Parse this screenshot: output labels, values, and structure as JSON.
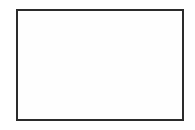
{
  "screen": {
    "name": "graphing-calculator-screen",
    "background_color": "#ffffff",
    "width": 195,
    "height": 130,
    "frame": {
      "label": "calculator display bezel",
      "x": 16,
      "y": 9,
      "width": 168,
      "height": 112,
      "border_color": "#2b2b2b",
      "border_width": 2,
      "fill_color": "#fefefe"
    }
  },
  "chart_data": {
    "type": "scatter",
    "title": "",
    "subtitle": "",
    "xlabel": "",
    "ylabel": "",
    "grid": false,
    "legend": null,
    "legend_position": "none",
    "plot_style": "graphing-calculator-pixel-plot",
    "axis_color": "#2b2b2b",
    "curve_color": "#2b2b2b",
    "origin_px": [
      100,
      65
    ],
    "pixels_per_unit": 8.4,
    "xlim": [
      -10,
      10
    ],
    "ylim": [
      -6.7,
      6.7
    ],
    "x_tick_interval": 1,
    "y_tick_interval": 1,
    "x_tick_values": [
      -9,
      -8,
      -7,
      -6,
      -5,
      -4,
      -3,
      -2,
      -1,
      1,
      2,
      3,
      4,
      5,
      6,
      7,
      8,
      9
    ],
    "y_tick_values": [
      -6,
      -5,
      -4,
      -3,
      -2,
      -1,
      1,
      2,
      3,
      4,
      5,
      6
    ],
    "tick_length_px": 4,
    "series": [
      {
        "name": "circle",
        "equation": "x^2 + y^2 = 25",
        "shape": "circle",
        "center": [
          0,
          0
        ],
        "radius": 5,
        "center_px": [
          100,
          65
        ],
        "radius_px": 42,
        "stroke_color": "#2b2b2b",
        "stroke_width": 1.1,
        "fill": "none"
      }
    ],
    "annotations": []
  }
}
